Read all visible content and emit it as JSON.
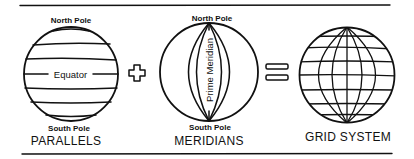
{
  "diagram": {
    "parallels": {
      "caption": "PARALLELS",
      "north_label": "North Pole",
      "south_label": "South Pole",
      "equator_label": "Equator"
    },
    "operator_plus": "+",
    "meridians": {
      "caption": "MERIDIANS",
      "north_label": "North Pole",
      "south_label": "South Pole",
      "prime_meridian_label": "Prime Meridian"
    },
    "operator_equals": "=",
    "grid_system": {
      "caption": "GRID SYSTEM"
    },
    "colors": {
      "ink": "#111111",
      "background": "#ffffff"
    }
  }
}
